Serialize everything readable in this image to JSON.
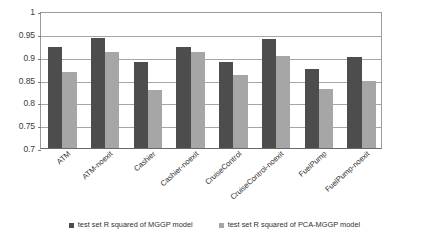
{
  "chart_data": {
    "type": "bar",
    "title": "",
    "subtitle": "",
    "xlabel": "",
    "ylabel": "",
    "ylim": [
      0.7,
      1
    ],
    "ytick_labels": [
      "1",
      "0.95",
      "0.9",
      "0.85",
      "0.8",
      "0.75",
      "0.7"
    ],
    "yticks": [
      1,
      0.95,
      0.9,
      0.85,
      0.8,
      0.75,
      0.7
    ],
    "grid": true,
    "legend_position": "bottom",
    "categories": [
      "ATM",
      "ATM-noexit",
      "Cashier",
      "Cashier-noexit",
      "CruiseControl",
      "CruiseControl-noexit",
      "FuelPump",
      "FuelPump-noexit"
    ],
    "series": [
      {
        "name": "test set R squared of MGGP model",
        "color": "#4d4d4d",
        "values": [
          0.922,
          0.941,
          0.888,
          0.921,
          0.888,
          0.939,
          0.874,
          0.899
        ]
      },
      {
        "name": "test set R squared of PCA-MGGP model",
        "color": "#a6a6a6",
        "values": [
          0.866,
          0.911,
          0.828,
          0.911,
          0.86,
          0.902,
          0.829,
          0.847
        ]
      }
    ]
  },
  "legend": {
    "items": [
      {
        "label": "test set R squared of MGGP model",
        "marker": "square-marker-dark"
      },
      {
        "label": "test set R squared of PCA-MGGP model",
        "marker": "square-marker-light"
      }
    ]
  },
  "colors": {
    "series_dark": "#4d4d4d",
    "series_light": "#a6a6a6",
    "gridline": "#a6a6a6",
    "axis": "#6a6a6a",
    "background": "#ffffff",
    "text": "#2f2f2f"
  }
}
